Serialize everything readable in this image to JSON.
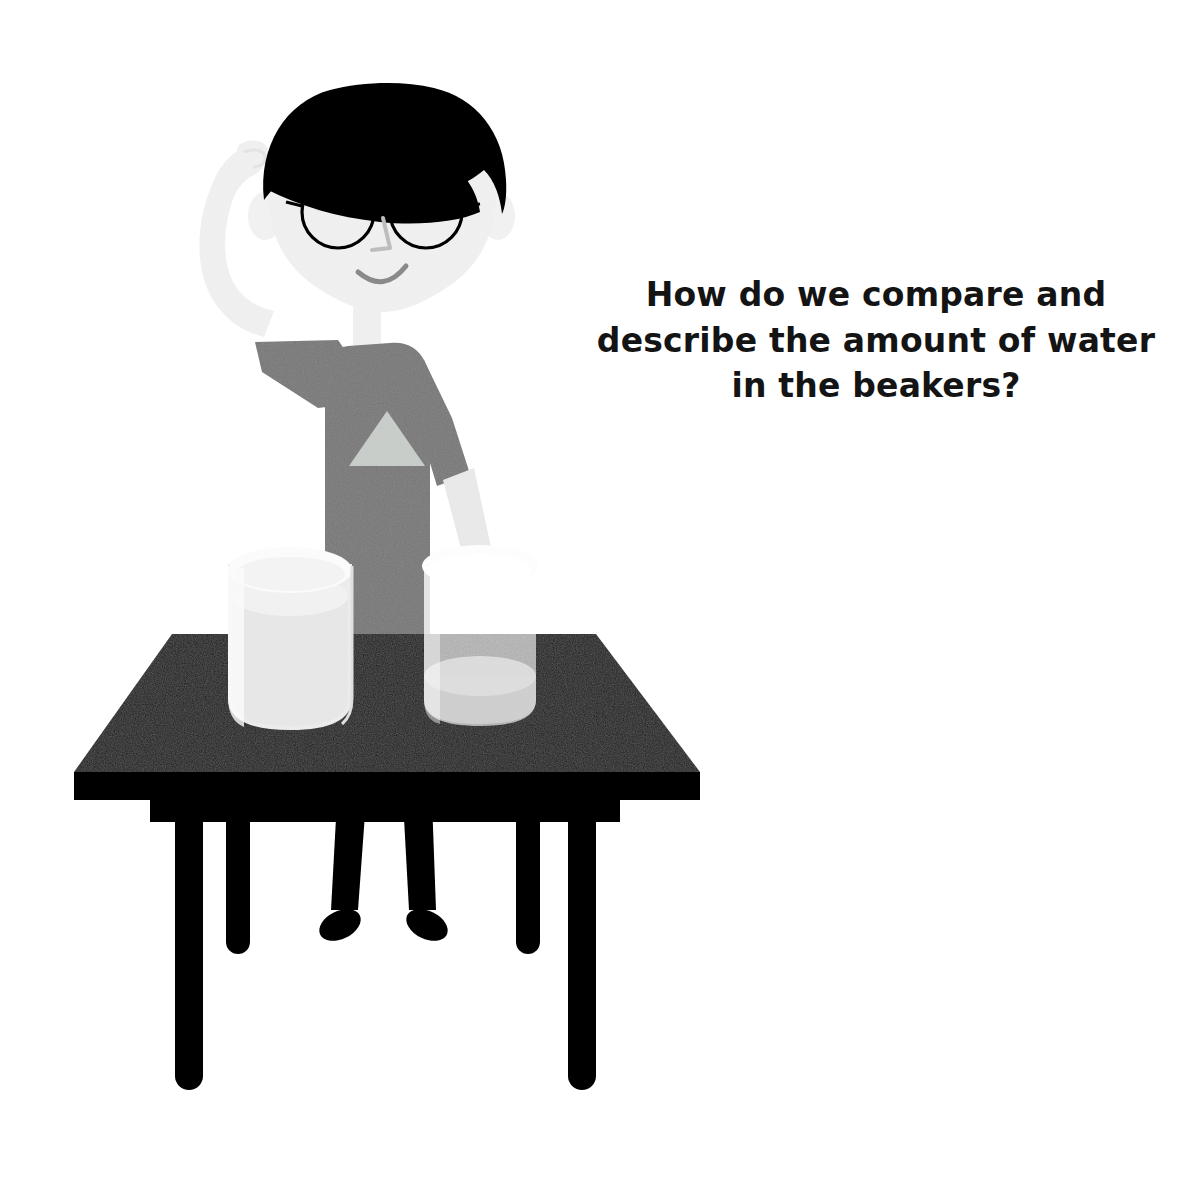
{
  "page": {
    "background_color": "#ffffff",
    "width": 1201,
    "height": 1178
  },
  "question": {
    "text": "How do we compare and\ndescribe the amount of water\nin the beakers?",
    "line_1": "How do we compare and",
    "line_2": "describe the amount of water",
    "line_3": "in the beakers?",
    "color": "#141414",
    "align": "center"
  },
  "illustration": {
    "title": "Boy at a table with two beakers of water",
    "character": {
      "name": "boy-student",
      "pose": "scratching head, puzzled",
      "hair_color": "#000000",
      "skin_color": "#f0f1f0",
      "shirt_color": "#777777",
      "shirt_emblem": "triangle",
      "shirt_emblem_color": "#c9cdca",
      "trousers_color": "#000000",
      "shoes_color": "#000000",
      "glasses_color": "#000000",
      "glasses_shape": "round",
      "eyes_color": "#000000",
      "mouth_color": "#8a8a8a",
      "nose_color": "#b9b9b9",
      "expression": "smiling"
    },
    "table": {
      "name": "lab-table",
      "top_color": "#1a1a1a",
      "edge_color": "#000000",
      "leg_color": "#000000",
      "leg_count": 4
    },
    "beakers": [
      {
        "name": "beaker-left",
        "label": "left beaker",
        "fill_level": "full",
        "fill_description": "more water",
        "water_color": "#e9eae9",
        "glass_color": "#f4f5f4",
        "rim_color": "#fbfbfb",
        "opacity": "opaque"
      },
      {
        "name": "beaker-right",
        "label": "right beaker",
        "fill_level": "empty",
        "fill_description": "less water",
        "water_color": "#cfd0cf",
        "glass_color": "#8c8d8c",
        "rim_color": "#fdfdfd",
        "opacity": "translucent"
      }
    ]
  }
}
